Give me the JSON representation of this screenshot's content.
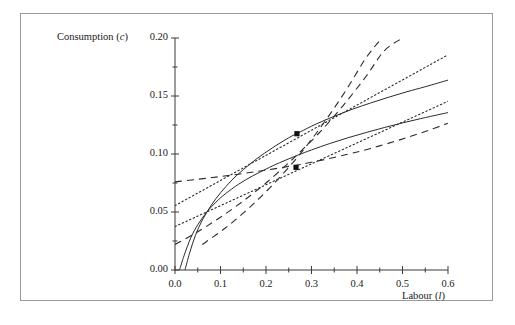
{
  "figure": {
    "background": "#ffffff",
    "frame_color": "#9a9a9a",
    "axis_color": "#3a3a3a",
    "ylabel": "Consumption (c)",
    "xlabel": "Labour (l)"
  },
  "chart_data": {
    "type": "line",
    "title": "",
    "xlabel": "Labour (l)",
    "ylabel": "Consumption (c)",
    "xlim": [
      0.0,
      0.6
    ],
    "ylim": [
      0.0,
      0.2
    ],
    "grid": false,
    "legend": "none",
    "xticks": [
      0.0,
      0.1,
      0.2,
      0.3,
      0.4,
      0.5,
      0.6
    ],
    "xtick_labels": [
      "0.0",
      "0.1",
      "0.2",
      "0.3",
      "0.4",
      "0.5",
      "0.6"
    ],
    "xminor_ticks": [
      0.05,
      0.15,
      0.25,
      0.35,
      0.45,
      0.55
    ],
    "yticks": [
      0.0,
      0.05,
      0.1,
      0.15,
      0.2
    ],
    "ytick_labels": [
      "0.00",
      "0.05",
      "0.10",
      "0.15",
      "0.20"
    ],
    "yminor_ticks": [
      0.025,
      0.075,
      0.125,
      0.175
    ],
    "series": [
      {
        "name": "production-function-upper",
        "style": "solid",
        "x": [
          0.01,
          0.02,
          0.035,
          0.05,
          0.07,
          0.09,
          0.11,
          0.14,
          0.17,
          0.2,
          0.23,
          0.27,
          0.3,
          0.34,
          0.38,
          0.42,
          0.46,
          0.5,
          0.54,
          0.58,
          0.6
        ],
        "y": [
          0.0,
          0.0125,
          0.028,
          0.039,
          0.05,
          0.0585,
          0.0655,
          0.074,
          0.081,
          0.087,
          0.0925,
          0.099,
          0.1035,
          0.109,
          0.114,
          0.1185,
          0.1228,
          0.1268,
          0.1305,
          0.134,
          0.1357
        ]
      },
      {
        "name": "production-function-lower",
        "style": "solid",
        "x": [
          0.022,
          0.032,
          0.045,
          0.06,
          0.08,
          0.1,
          0.125,
          0.15,
          0.18,
          0.215,
          0.25,
          0.275,
          0.31,
          0.35,
          0.39,
          0.43,
          0.47,
          0.51,
          0.55,
          0.6
        ],
        "y": [
          0.0,
          0.0145,
          0.03,
          0.043,
          0.056,
          0.0665,
          0.0775,
          0.0865,
          0.096,
          0.1055,
          0.114,
          0.119,
          0.1258,
          0.1325,
          0.1386,
          0.144,
          0.149,
          0.1537,
          0.158,
          0.1637
        ]
      },
      {
        "name": "budget-line-upper",
        "style": "dotted",
        "x": [
          0.0,
          0.6
        ],
        "y": [
          0.0555,
          0.1855
        ]
      },
      {
        "name": "budget-line-lower",
        "style": "dotted",
        "x": [
          0.0,
          0.6
        ],
        "y": [
          0.0375,
          0.1455
        ]
      },
      {
        "name": "indifference-curve-flat",
        "style": "dashed",
        "x": [
          0.0,
          0.05,
          0.1,
          0.15,
          0.2,
          0.25,
          0.275,
          0.32,
          0.38,
          0.43,
          0.48,
          0.52,
          0.56,
          0.6
        ],
        "y": [
          0.076,
          0.0782,
          0.0806,
          0.0832,
          0.0861,
          0.0893,
          0.091,
          0.0945,
          0.0998,
          0.1048,
          0.1105,
          0.1155,
          0.1208,
          0.1265
        ]
      },
      {
        "name": "indifference-curve-steep",
        "style": "dashed",
        "x": [
          0.0,
          0.05,
          0.1,
          0.15,
          0.2,
          0.25,
          0.275,
          0.32,
          0.37,
          0.42,
          0.46,
          0.5
        ],
        "y": [
          0.022,
          0.033,
          0.0455,
          0.0595,
          0.075,
          0.0925,
          0.1018,
          0.1195,
          0.142,
          0.167,
          0.189,
          0.2
        ]
      },
      {
        "name": "indifference-curve-steep-outer",
        "style": "dashed",
        "x": [
          0.06,
          0.11,
          0.16,
          0.21,
          0.26,
          0.3,
          0.34,
          0.38,
          0.42,
          0.455
        ],
        "y": [
          0.022,
          0.036,
          0.0525,
          0.0715,
          0.093,
          0.1125,
          0.134,
          0.1575,
          0.183,
          0.2
        ]
      }
    ],
    "points": [
      {
        "name": "equilibrium-upper",
        "x": 0.268,
        "y": 0.1175,
        "marker": "square-filled"
      },
      {
        "name": "equilibrium-lower",
        "x": 0.266,
        "y": 0.0885,
        "marker": "square-filled"
      }
    ]
  }
}
